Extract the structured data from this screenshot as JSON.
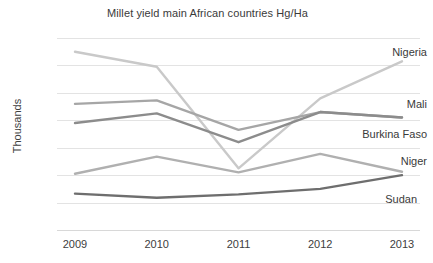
{
  "chart_data": {
    "type": "line",
    "title": "Millet yield main African countries Hg/Ha",
    "xlabel": "",
    "ylabel": "Thousands",
    "categories": [
      "2009",
      "2010",
      "2011",
      "2012",
      "2013"
    ],
    "x": [
      2009,
      2010,
      2011,
      2012,
      2013
    ],
    "ylim": [
      0,
      14
    ],
    "yticks": [
      0,
      2,
      4,
      6,
      8,
      10,
      12,
      14
    ],
    "ytick_labels": [
      "0",
      "2",
      "4",
      "6",
      "8",
      "10",
      "12",
      "14"
    ],
    "grid": true,
    "legend_position": "right-inline-labels",
    "series": [
      {
        "name": "Nigeria",
        "color": "#c9c9c9",
        "values": [
          13.0,
          11.9,
          4.5,
          9.6,
          12.3
        ]
      },
      {
        "name": "Mali",
        "color": "#a6a6a6",
        "values": [
          9.2,
          9.45,
          7.3,
          8.6,
          8.2
        ]
      },
      {
        "name": "Burkina Faso",
        "color": "#8c8c8c",
        "values": [
          7.8,
          8.5,
          6.4,
          8.6,
          8.2
        ]
      },
      {
        "name": "Niger",
        "color": "#b0b0b0",
        "values": [
          4.1,
          5.35,
          4.2,
          5.55,
          4.25
        ]
      },
      {
        "name": "Sudan",
        "color": "#6e6e6e",
        "values": [
          2.65,
          2.35,
          2.6,
          3.0,
          4.0
        ]
      }
    ]
  },
  "labels": {
    "nigeria": "Nigeria",
    "mali": "Mali",
    "burkina_faso": "Burkina Faso",
    "niger": "Niger",
    "sudan": "Sudan"
  }
}
